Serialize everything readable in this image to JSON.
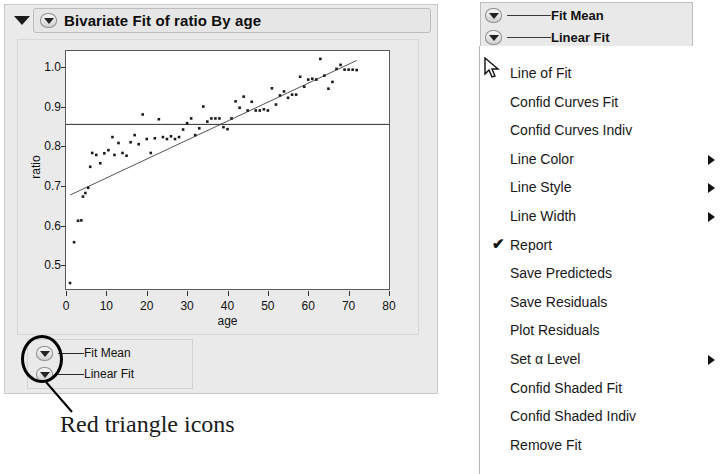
{
  "report": {
    "title": "Bivariate Fit of ratio By age",
    "disclosure_icon": "red-triangle-icon",
    "legend": [
      {
        "label": "Fit Mean",
        "icon": "red-triangle-icon"
      },
      {
        "label": "Linear Fit",
        "icon": "red-triangle-icon"
      }
    ]
  },
  "annotation": {
    "text": "Red triangle icons"
  },
  "right_legend": [
    {
      "label": "Fit Mean",
      "icon": "red-triangle-icon"
    },
    {
      "label": "Linear Fit",
      "icon": "red-triangle-icon"
    }
  ],
  "menu": {
    "cursor_icon": "mouse-pointer-icon",
    "items": [
      {
        "label": "Line of Fit",
        "checked": false,
        "submenu": false
      },
      {
        "label": "Confid Curves Fit",
        "checked": false,
        "submenu": false
      },
      {
        "label": "Confid Curves Indiv",
        "checked": false,
        "submenu": false
      },
      {
        "label": "Line Color",
        "checked": false,
        "submenu": true
      },
      {
        "label": "Line Style",
        "checked": false,
        "submenu": true
      },
      {
        "label": "Line Width",
        "checked": false,
        "submenu": true
      },
      {
        "label": "Report",
        "checked": true,
        "submenu": false
      },
      {
        "label": "Save Predicteds",
        "checked": false,
        "submenu": false
      },
      {
        "label": "Save Residuals",
        "checked": false,
        "submenu": false
      },
      {
        "label": "Plot Residuals",
        "checked": false,
        "submenu": false
      },
      {
        "label": "Set α Level",
        "checked": false,
        "submenu": true
      },
      {
        "label": "Confid Shaded Fit",
        "checked": false,
        "submenu": false
      },
      {
        "label": "Confid Shaded Indiv",
        "checked": false,
        "submenu": false
      },
      {
        "label": "Remove Fit",
        "checked": false,
        "submenu": false
      }
    ],
    "check_glyph": "✔"
  },
  "chart_data": {
    "type": "scatter",
    "title": "Bivariate Fit of ratio By age",
    "xlabel": "age",
    "ylabel": "ratio",
    "xlim": [
      0,
      80
    ],
    "ylim": [
      0.44,
      1.04
    ],
    "xticks": [
      0,
      10,
      20,
      30,
      40,
      50,
      60,
      70,
      80
    ],
    "yticks": [
      0.5,
      0.6,
      0.7,
      0.8,
      0.9,
      1.0
    ],
    "ytick_labels": [
      "0.5",
      "0.6",
      "0.7",
      "0.8",
      "0.9",
      "1.0"
    ],
    "xtick_labels": [
      "0",
      "10",
      "20",
      "30",
      "40",
      "50",
      "60",
      "70",
      "80"
    ],
    "grid": false,
    "legend_position": "below-plot",
    "series": [
      {
        "name": "Fit Mean",
        "type": "hline",
        "value": 0.855,
        "color": "#2b2b2b"
      },
      {
        "name": "Linear Fit",
        "type": "line",
        "intercept": 0.672,
        "slope": 0.00478,
        "x_range": [
          1,
          72
        ],
        "color": "#555555"
      },
      {
        "name": "ratio vs age",
        "type": "scatter",
        "color": "#1a1a1a",
        "points": [
          [
            1.0,
            0.455
          ],
          [
            2.0,
            0.558
          ],
          [
            3.0,
            0.612
          ],
          [
            3.8,
            0.613
          ],
          [
            4.2,
            0.673
          ],
          [
            4.8,
            0.682
          ],
          [
            5.5,
            0.695
          ],
          [
            6.0,
            0.748
          ],
          [
            6.5,
            0.783
          ],
          [
            7.5,
            0.778
          ],
          [
            8.5,
            0.757
          ],
          [
            9.5,
            0.782
          ],
          [
            10.5,
            0.79
          ],
          [
            11.5,
            0.823
          ],
          [
            12.0,
            0.778
          ],
          [
            13.0,
            0.808
          ],
          [
            14.0,
            0.783
          ],
          [
            15.0,
            0.776
          ],
          [
            16.0,
            0.81
          ],
          [
            17.0,
            0.828
          ],
          [
            18.0,
            0.805
          ],
          [
            19.0,
            0.88
          ],
          [
            20.0,
            0.818
          ],
          [
            21.0,
            0.783
          ],
          [
            22.0,
            0.82
          ],
          [
            23.0,
            0.868
          ],
          [
            24.0,
            0.823
          ],
          [
            25.0,
            0.818
          ],
          [
            26.0,
            0.825
          ],
          [
            27.0,
            0.818
          ],
          [
            28.0,
            0.823
          ],
          [
            29.0,
            0.842
          ],
          [
            30.0,
            0.858
          ],
          [
            31.0,
            0.87
          ],
          [
            32.0,
            0.828
          ],
          [
            33.0,
            0.845
          ],
          [
            34.0,
            0.9
          ],
          [
            35.0,
            0.862
          ],
          [
            36.0,
            0.87
          ],
          [
            37.0,
            0.87
          ],
          [
            38.0,
            0.87
          ],
          [
            39.0,
            0.848
          ],
          [
            40.0,
            0.843
          ],
          [
            41.0,
            0.87
          ],
          [
            42.0,
            0.913
          ],
          [
            43.0,
            0.897
          ],
          [
            44.0,
            0.925
          ],
          [
            45.0,
            0.89
          ],
          [
            46.0,
            0.912
          ],
          [
            47.0,
            0.89
          ],
          [
            48.0,
            0.89
          ],
          [
            49.0,
            0.893
          ],
          [
            50.0,
            0.89
          ],
          [
            51.0,
            0.946
          ],
          [
            52.0,
            0.905
          ],
          [
            53.0,
            0.928
          ],
          [
            54.0,
            0.938
          ],
          [
            55.0,
            0.922
          ],
          [
            56.0,
            0.93
          ],
          [
            57.0,
            0.93
          ],
          [
            58.0,
            0.975
          ],
          [
            59.0,
            0.95
          ],
          [
            60.0,
            0.968
          ],
          [
            61.0,
            0.97
          ],
          [
            62.0,
            0.968
          ],
          [
            63.0,
            1.02
          ],
          [
            64.0,
            0.978
          ],
          [
            65.0,
            0.945
          ],
          [
            66.0,
            0.962
          ],
          [
            67.0,
            0.995
          ],
          [
            68.0,
            1.005
          ],
          [
            69.0,
            0.993
          ],
          [
            70.0,
            0.993
          ],
          [
            71.0,
            0.993
          ],
          [
            72.0,
            0.992
          ]
        ]
      }
    ]
  }
}
